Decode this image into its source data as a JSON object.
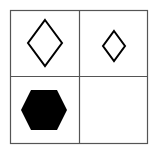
{
  "diagram": {
    "type": "2x2 shape grid (visual analogy puzzle)",
    "background_color": "#ffffff",
    "line_color": "#555555",
    "shape_color": "#000000",
    "grid": {
      "rows": 2,
      "cols": 2,
      "outer": {
        "x": 10.5,
        "y": 10.5,
        "width": 137,
        "height": 133
      },
      "vertical_divider_x": 79.5,
      "horizontal_divider_y": 76.5
    },
    "cells": [
      {
        "position": "top-left",
        "shape": "diamond",
        "size": "large",
        "fill": "none",
        "stroke": "#000000",
        "points": "45,20 62,43 45,66 28,43"
      },
      {
        "position": "top-right",
        "shape": "diamond",
        "size": "small",
        "fill": "none",
        "stroke": "#000000",
        "points": "114,31 125,46 114,61 103,46"
      },
      {
        "position": "bottom-left",
        "shape": "hexagon",
        "size": "large",
        "fill": "#000000",
        "stroke": "none",
        "points": "31,90 57,90 67,110 57,130 31,130 21,110"
      },
      {
        "position": "bottom-right",
        "shape": "empty",
        "size": "",
        "fill": "none",
        "stroke": "none",
        "points": ""
      }
    ]
  }
}
